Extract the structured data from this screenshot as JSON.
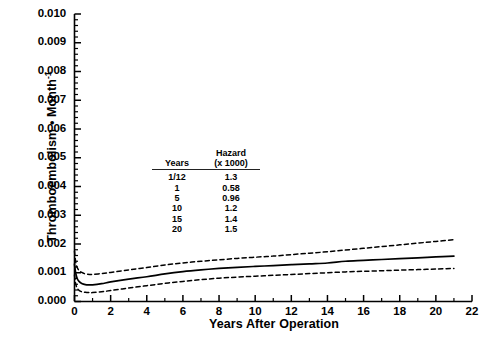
{
  "chart_data": {
    "type": "line",
    "title": "",
    "xlabel": "Years After Operation",
    "ylabel": "Thromboembolism • Month⁻¹",
    "xlim": [
      0,
      22
    ],
    "ylim": [
      0,
      0.01
    ],
    "grid": false,
    "legend": "none",
    "xticks": [
      0,
      2,
      4,
      6,
      8,
      10,
      12,
      14,
      16,
      18,
      20,
      22
    ],
    "xtick_labels": [
      "0",
      "2",
      "4",
      "6",
      "8",
      "10",
      "12",
      "14",
      "16",
      "18",
      "20",
      "22"
    ],
    "yticks": [
      0.0,
      0.001,
      0.002,
      0.003,
      0.004,
      0.005,
      0.006,
      0.007,
      0.008,
      0.009,
      0.01
    ],
    "ytick_labels": [
      "0.000",
      "0.001",
      "0.002",
      "0.003",
      "0.004",
      "0.005",
      "0.006",
      "0.007",
      "0.008",
      "0.009",
      "0.010"
    ],
    "x_minor_tick_interval": 1,
    "y_minor_tick_interval": 0.0002,
    "series": [
      {
        "name": "Hazard estimate",
        "style": "solid",
        "x": [
          0.0,
          0.04,
          0.08,
          0.15,
          0.25,
          0.4,
          0.6,
          0.83,
          1.0,
          1.5,
          2.0,
          3.0,
          4.0,
          5.0,
          6.0,
          7.0,
          8.0,
          9.0,
          10.0,
          11.0,
          12.0,
          13.0,
          14.0,
          15.0,
          16.0,
          17.0,
          18.0,
          19.0,
          20.0,
          21.0
        ],
        "y": [
          0.0013,
          0.0011,
          0.00095,
          0.0008,
          0.0007,
          0.00063,
          0.00059,
          0.00058,
          0.00058,
          0.00062,
          0.00068,
          0.00078,
          0.00086,
          0.00096,
          0.00104,
          0.0011,
          0.00115,
          0.00119,
          0.00122,
          0.00125,
          0.00128,
          0.00131,
          0.00134,
          0.0014,
          0.00143,
          0.00146,
          0.00149,
          0.00152,
          0.00155,
          0.00158
        ]
      },
      {
        "name": "Upper 70% confidence limit",
        "style": "dashed",
        "x": [
          0.0,
          0.04,
          0.08,
          0.15,
          0.25,
          0.4,
          0.6,
          0.83,
          1.0,
          1.5,
          2.0,
          3.0,
          4.0,
          5.0,
          6.0,
          7.0,
          8.0,
          9.0,
          10.0,
          11.0,
          12.0,
          13.0,
          14.0,
          15.0,
          16.0,
          17.0,
          18.0,
          19.0,
          20.0,
          21.0
        ],
        "y": [
          0.00175,
          0.0015,
          0.00133,
          0.00118,
          0.00108,
          0.00101,
          0.00096,
          0.00094,
          0.00094,
          0.00097,
          0.00101,
          0.0011,
          0.00118,
          0.00127,
          0.00134,
          0.0014,
          0.00145,
          0.0015,
          0.00154,
          0.00158,
          0.00163,
          0.00168,
          0.00173,
          0.00179,
          0.00185,
          0.00191,
          0.00197,
          0.00203,
          0.00209,
          0.00215
        ]
      },
      {
        "name": "Lower 70% confidence limit",
        "style": "dashed",
        "x": [
          0.0,
          0.04,
          0.08,
          0.15,
          0.25,
          0.4,
          0.6,
          0.83,
          1.0,
          1.5,
          2.0,
          3.0,
          4.0,
          5.0,
          6.0,
          7.0,
          8.0,
          9.0,
          10.0,
          11.0,
          12.0,
          13.0,
          14.0,
          15.0,
          16.0,
          17.0,
          18.0,
          19.0,
          20.0,
          21.0
        ],
        "y": [
          0.00092,
          0.00072,
          0.00058,
          0.00046,
          0.00039,
          0.00034,
          0.00032,
          0.00031,
          0.00031,
          0.00034,
          0.00038,
          0.00047,
          0.00055,
          0.00063,
          0.0007,
          0.00076,
          0.00081,
          0.00085,
          0.00088,
          0.00091,
          0.00094,
          0.00097,
          0.001,
          0.00103,
          0.00105,
          0.00107,
          0.00109,
          0.00111,
          0.00113,
          0.00115
        ]
      }
    ],
    "inset_table": {
      "headers": [
        "Years",
        "Hazard"
      ],
      "header_sub": [
        "",
        "(x 1000)"
      ],
      "rows": [
        [
          "1/12",
          "1.3"
        ],
        [
          "1",
          "0.58"
        ],
        [
          "5",
          "0.96"
        ],
        [
          "10",
          "1.2"
        ],
        [
          "15",
          "1.4"
        ],
        [
          "20",
          "1.5"
        ]
      ]
    }
  }
}
